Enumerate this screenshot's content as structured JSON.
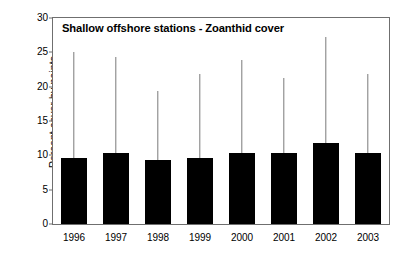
{
  "chart_data": {
    "type": "bar",
    "title": "Shallow offshore stations - Zoanthid cover",
    "xlabel": "",
    "ylabel": "Percent cover by points",
    "categories": [
      "1996",
      "1997",
      "1998",
      "1999",
      "2000",
      "2001",
      "2002",
      "2003"
    ],
    "values": [
      9.6,
      10.4,
      9.3,
      9.6,
      10.3,
      10.3,
      11.8,
      10.4
    ],
    "error_upper": [
      25.1,
      24.3,
      19.4,
      21.9,
      23.9,
      21.2,
      27.2,
      21.9
    ],
    "series": [
      {
        "name": "Zoanthid cover",
        "values": [
          9.6,
          10.4,
          9.3,
          9.6,
          10.3,
          10.3,
          11.8,
          10.4
        ]
      }
    ],
    "ylim": [
      0,
      30
    ],
    "yticks": [
      0,
      5,
      10,
      15,
      20,
      25,
      30
    ],
    "ytick_labels": [
      "0",
      "5",
      "10",
      "15",
      "20",
      "25",
      "30"
    ],
    "grid": false,
    "legend": false,
    "legend_position": "none",
    "bar_color": "#000000",
    "error_bar_color": "#7a7a7a",
    "axis_color": "#6f6f6f",
    "error_bar_style": "upper-only",
    "annotations": []
  }
}
